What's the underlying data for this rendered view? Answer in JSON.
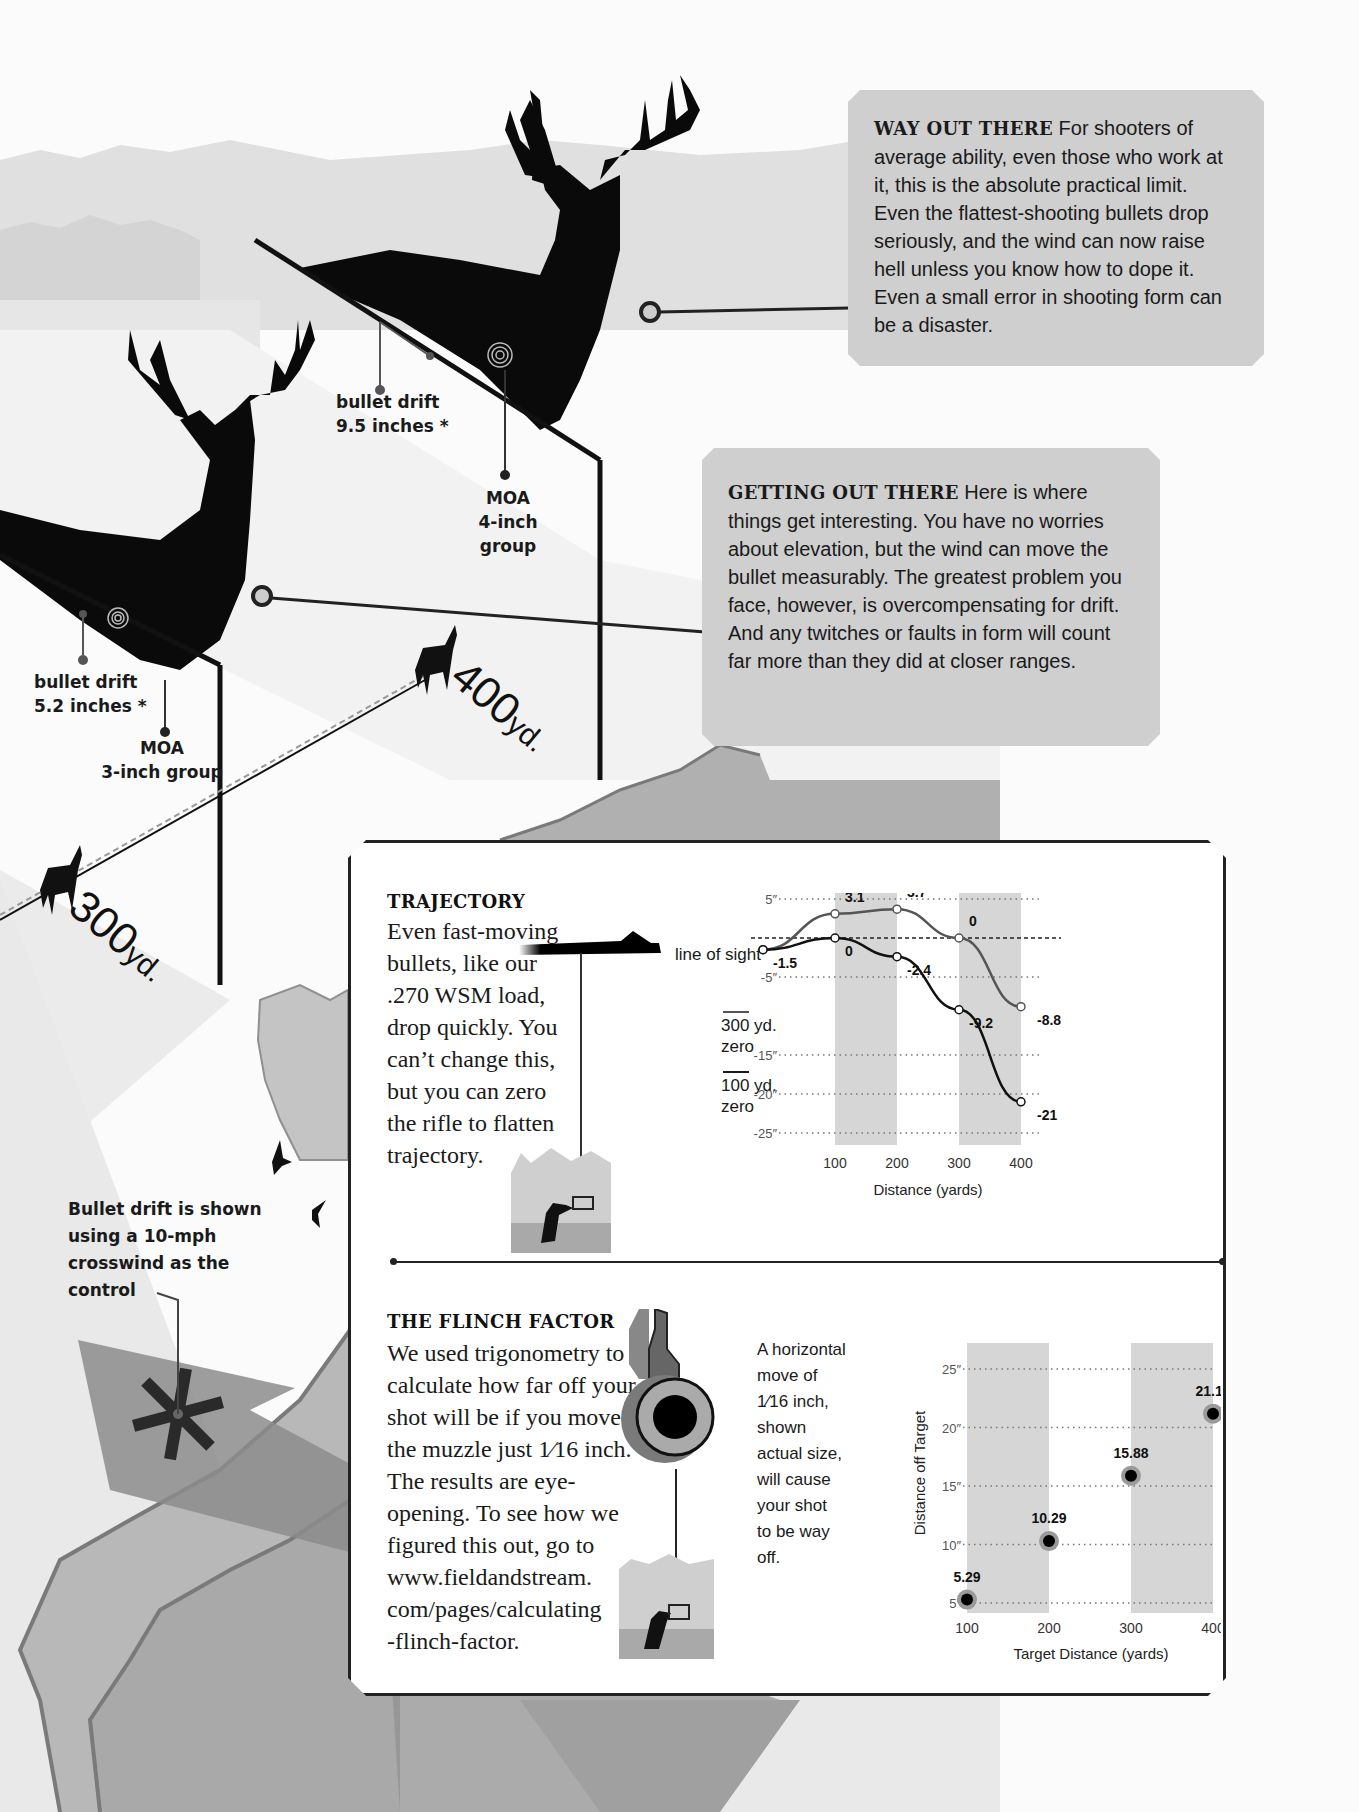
{
  "callouts": {
    "way_out_there": {
      "heading": "WAY OUT THERE",
      "body": "For shooters of average ability, even those who work at it, this is the absolute practical limit. Even the flattest-shooting bullets drop seriously, and the wind can now raise hell unless you know how to dope it. Even a small error in shooting form can be a disaster."
    },
    "getting_out_there": {
      "heading": "GETTING OUT THERE",
      "body": "Here is where things get interesting. You have no worries about elevation, but the wind can move the bullet measurably. The greatest problem you face, however, is overcompensating for drift. And any twitches or faults in form will count far more than they did at closer ranges."
    }
  },
  "deer_labels": {
    "far_deer": {
      "drift_line1": "bullet drift",
      "drift_line2": "9.5 inches *",
      "moa_line1": "MOA",
      "moa_line2": "4-inch group"
    },
    "near_deer": {
      "drift_line1": "bullet drift",
      "drift_line2": "5.2 inches *",
      "moa_line1": "MOA",
      "moa_line2": "3-inch group"
    }
  },
  "distance_markers": {
    "near": {
      "number": "300",
      "unit": "yd."
    },
    "far": {
      "number": "400",
      "unit": "yd."
    }
  },
  "footnote": {
    "line1": "Bullet drift is shown",
    "line2": "using a 10-mph",
    "line3": "crosswind as the",
    "line4": "control"
  },
  "trajectory": {
    "title": "TRAJECTORY",
    "body_lines": [
      "Even fast-moving",
      "bullets, like our",
      ".270 WSM load,",
      "drop quickly. You",
      "can’t change this,",
      "but you can zero",
      "the rifle to flatten",
      "trajectory."
    ],
    "line_of_sight_label": "line of sight",
    "legend": [
      {
        "line1": "300 yd.",
        "line2": "zero",
        "color": "#555555"
      },
      {
        "line1": "100 yd.",
        "line2": "zero",
        "color": "#1a1a1a"
      }
    ]
  },
  "flinch": {
    "title": "THE FLINCH FACTOR",
    "body_lines": [
      "We used trigonometry to",
      "calculate how far off your",
      "shot will be if you move",
      "the muzzle just 1⁄16 inch.",
      "The results are eye-",
      "opening. To see how we",
      "figured this out, go to",
      "www.fieldandstream.",
      "com/pages/calculating",
      "-flinch-factor."
    ],
    "note_lines": [
      "A horizontal",
      "move of",
      "1⁄16 inch,",
      "shown",
      "actual size,",
      "will cause",
      "your shot",
      "to be way",
      "off."
    ]
  },
  "chart_data": [
    {
      "type": "line",
      "title": "Trajectory",
      "xlabel": "Distance (yards)",
      "ylabel": "",
      "x": [
        0,
        100,
        200,
        300,
        400
      ],
      "x_ticks": [
        "100",
        "200",
        "300",
        "400"
      ],
      "y_ticks": [
        "5″",
        "-5″",
        "-15″",
        "-20″",
        "-25″"
      ],
      "ylim": [
        -25,
        5
      ],
      "grid": "dotted horizontal",
      "shaded_bands": [
        [
          100,
          200
        ],
        [
          300,
          400
        ]
      ],
      "reference_line": {
        "label": "line of sight",
        "y": 0
      },
      "series": [
        {
          "name": "300 yd. zero",
          "values": [
            -1.5,
            3.1,
            3.7,
            0,
            -8.8
          ],
          "labels": [
            "-1.5",
            "3.1",
            "3.7",
            "0",
            "-8.8"
          ]
        },
        {
          "name": "100 yd. zero",
          "values": [
            -1.5,
            0,
            -2.4,
            -9.2,
            -21
          ],
          "labels": [
            "",
            "0",
            "-2.4",
            "-9.2",
            "-21"
          ]
        }
      ]
    },
    {
      "type": "scatter",
      "title": "The Flinch Factor",
      "xlabel": "Target Distance (yards)",
      "ylabel": "Distance off Target",
      "categories": [
        "100",
        "200",
        "300",
        "400"
      ],
      "values": [
        5.29,
        10.29,
        15.88,
        21.18
      ],
      "labels": [
        "5.29",
        "10.29",
        "15.88",
        "21.18"
      ],
      "y_ticks": [
        "5″",
        "10″",
        "15″",
        "20″",
        "25″"
      ],
      "ylim": [
        5,
        25
      ],
      "grid": "dotted horizontal",
      "shaded_bands": [
        [
          100,
          200
        ],
        [
          300,
          400
        ]
      ]
    }
  ]
}
